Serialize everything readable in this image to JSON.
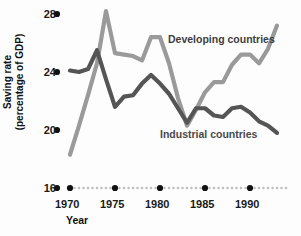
{
  "chart_data": {
    "type": "line",
    "title": "",
    "xlabel": "Year",
    "ylabel": "Saving rate (percentage of GDP)",
    "ylabel_line1": "Saving rate",
    "ylabel_line2": "(percentage of GDP)",
    "xlim": [
      1969,
      1994
    ],
    "ylim": [
      16,
      28
    ],
    "yticks": [
      16,
      20,
      24,
      28
    ],
    "ytick_labels": [
      "16",
      "20",
      "24",
      "28"
    ],
    "xticks": [
      1970,
      1975,
      1980,
      1985,
      1990
    ],
    "xtick_labels": [
      "1970",
      "1975",
      "1980",
      "1985",
      "1990"
    ],
    "grid": false,
    "legend_position": "inline-annotation",
    "x": [
      1970,
      1971,
      1972,
      1973,
      1974,
      1975,
      1976,
      1977,
      1978,
      1979,
      1980,
      1981,
      1982,
      1983,
      1984,
      1985,
      1986,
      1987,
      1988,
      1989,
      1990,
      1991,
      1992,
      1993
    ],
    "series": [
      {
        "name": "Developing countries",
        "color": "#9a9a9a",
        "values": [
          18.3,
          20.3,
          22.4,
          24.6,
          28.2,
          25.3,
          25.2,
          25.1,
          24.8,
          26.4,
          26.4,
          24.6,
          22.2,
          20.3,
          21.4,
          22.6,
          23.3,
          23.3,
          24.5,
          25.2,
          25.2,
          24.6,
          25.6,
          27.2
        ]
      },
      {
        "name": "Industrial countries",
        "color": "#555555",
        "values": [
          24.1,
          24.0,
          24.2,
          25.5,
          23.5,
          21.6,
          22.3,
          22.4,
          23.2,
          23.8,
          23.2,
          22.5,
          21.5,
          20.5,
          21.5,
          21.5,
          21.0,
          20.9,
          21.5,
          21.6,
          21.2,
          20.6,
          20.3,
          19.8
        ]
      }
    ],
    "annotations": [
      {
        "text": "Developing countries",
        "series": "Developing countries"
      },
      {
        "text": "Industrial countries",
        "series": "Industrial countries"
      }
    ]
  },
  "axis": {
    "x_tick_dots": "large-dot-at-labeled-ticks",
    "x_minor_dots": "small-dot-between-years",
    "dot_color": "#111111",
    "minor_dot_color": "#bdbdbd"
  }
}
